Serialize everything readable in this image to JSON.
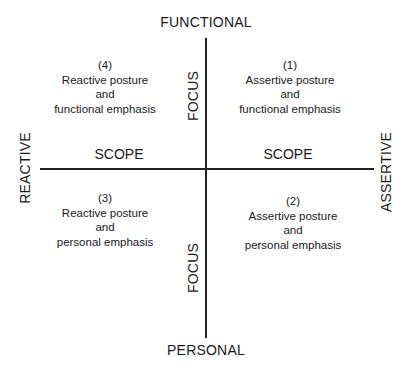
{
  "axes": {
    "top": "FUNCTIONAL",
    "bottom": "PERSONAL",
    "left": "REACTIVE",
    "right": "ASSERTIVE",
    "vertical_dimension": "FOCUS",
    "horizontal_dimension": "SCOPE"
  },
  "quadrants": [
    {
      "number": "(1)",
      "line1": "Assertive posture",
      "line2": "and",
      "line3": "functional emphasis"
    },
    {
      "number": "(2)",
      "line1": "Assertive posture",
      "line2": "and",
      "line3": "personal emphasis"
    },
    {
      "number": "(3)",
      "line1": "Reactive posture",
      "line2": "and",
      "line3": "personal emphasis"
    },
    {
      "number": "(4)",
      "line1": "Reactive posture",
      "line2": "and",
      "line3": "functional emphasis"
    }
  ],
  "colors": {
    "line": "#222222",
    "text": "#1a1a1a",
    "background": "#ffffff"
  }
}
